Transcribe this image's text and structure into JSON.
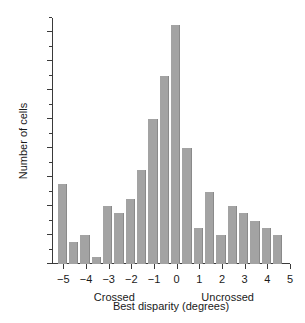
{
  "chart_data": {
    "type": "bar",
    "title": "",
    "subtitle": "",
    "xlabel": "Best disparity (degrees)",
    "ylabel": "Number of cells",
    "xlim": [
      -5.5,
      5.0
    ],
    "ylim": [
      0,
      34
    ],
    "grid": false,
    "legend": null,
    "bin_width": 0.5,
    "x_tick_labels": [
      "−5",
      "−4",
      "−3",
      "−2",
      "−1",
      "0",
      "1",
      "2",
      "3",
      "4",
      "5"
    ],
    "x_tick_values": [
      -5,
      -4,
      -3,
      -2,
      -1,
      0,
      1,
      2,
      3,
      4,
      5
    ],
    "y_tick_labels": [
      "0",
      "4",
      "8",
      "12",
      "16",
      "20",
      "24",
      "28",
      "32"
    ],
    "y_tick_values": [
      0,
      4,
      8,
      12,
      16,
      20,
      24,
      28,
      32
    ],
    "y_minor_ticks": [
      2,
      6,
      10,
      14,
      18,
      22,
      26,
      30,
      34
    ],
    "annotations": [
      {
        "text": "Crossed",
        "x": -2.75
      },
      {
        "text": "Uncrossed",
        "x": 2.25
      }
    ],
    "bin_left_edges": [
      -5.25,
      -4.75,
      -4.25,
      -3.75,
      -3.25,
      -2.75,
      -2.25,
      -1.75,
      -1.25,
      -0.75,
      -0.25,
      0.25,
      0.75,
      1.25,
      1.75,
      2.25,
      2.75,
      3.25,
      3.75,
      4.25
    ],
    "categories": [
      "-5.0",
      "-4.5",
      "-4.0",
      "-3.5",
      "-3.0",
      "-2.5",
      "-2.0",
      "-1.5",
      "-1.0",
      "-0.5",
      "0.0",
      "0.5",
      "1.0",
      "1.5",
      "2.0",
      "2.5",
      "3.0",
      "3.5",
      "4.0",
      "4.5"
    ],
    "values": [
      11,
      3,
      4,
      1,
      8,
      7,
      9,
      13,
      20,
      26,
      33,
      16,
      5,
      10,
      4,
      8,
      7,
      6,
      5,
      4
    ]
  },
  "colors": {
    "bar_fill": "#a3a3a3",
    "bar_edge": "#8a8a8a",
    "axis": "#3a3a3a",
    "text": "#1a1a1a",
    "background": "#ffffff"
  }
}
